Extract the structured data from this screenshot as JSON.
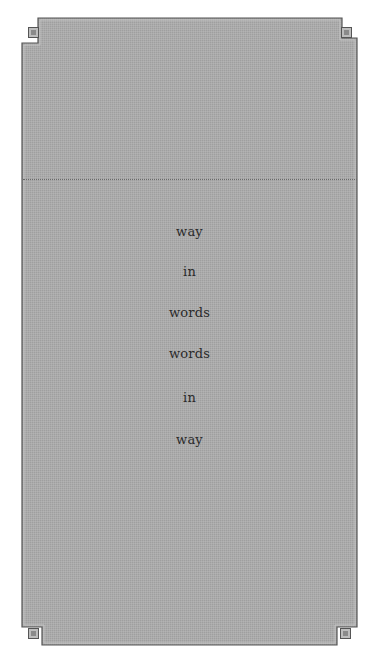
{
  "page": {
    "background_color": "#ffffff",
    "panel_color": "#a9a9a9",
    "border_color": "#5a5a5a",
    "divider_style": "dotted"
  },
  "poem": {
    "lines": [
      {
        "text": "way",
        "y": 232
      },
      {
        "text": "in",
        "y": 272
      },
      {
        "text": "words",
        "y": 314
      },
      {
        "text": "words",
        "y": 354
      },
      {
        "text": "in",
        "y": 398
      },
      {
        "text": "way",
        "y": 440
      }
    ]
  }
}
